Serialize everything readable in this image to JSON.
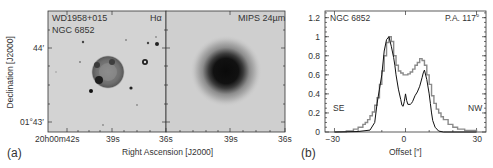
{
  "figure": {
    "panel_a": {
      "label": "(a)",
      "left_image": {
        "object_name": "WD1958+015",
        "object_alt_name": "NGC 6852",
        "band_label": "Hα"
      },
      "right_image": {
        "band_label": "MIPS 24µm"
      },
      "ylabel": "Declination [J2000]",
      "xlabel": "Right Ascension [J2000]",
      "y_ticks": [
        "44′",
        "01°43′"
      ],
      "x_ticks_left": [
        "20h00m42s",
        "39s",
        "36s"
      ],
      "x_ticks_right": [
        "39s",
        "36s"
      ]
    },
    "panel_b": {
      "label": "(b)",
      "title_left": "NGC 6852",
      "title_right": "P.A. 117°",
      "annot_left": "SE",
      "annot_right": "NW",
      "xlabel": "Offset [″]"
    }
  },
  "chart_data": {
    "type": "line",
    "title": "NGC 6852",
    "subtitle": "P.A. 117°",
    "xlabel": "Offset [″]",
    "ylabel": "",
    "xlim": [
      -34,
      34
    ],
    "ylim": [
      0,
      1.27
    ],
    "x_ticks": [
      -30,
      0,
      30
    ],
    "y_ticks": [
      0,
      0.2,
      0.4,
      0.6,
      0.8,
      1,
      1.2
    ],
    "y_tick_labels": [
      "0",
      "0.2",
      "0.4",
      "0.6",
      "0.8",
      "1",
      "1.2"
    ],
    "grid": false,
    "annotations": [
      "SE",
      "NW"
    ],
    "series": [
      {
        "name": "MIPS 24µm (gray, stepped)",
        "color": "#8a8a8a",
        "style": "step",
        "x": [
          -30,
          -25,
          -22,
          -20,
          -18,
          -17,
          -16,
          -15,
          -14,
          -13,
          -12,
          -11,
          -10,
          -9,
          -8,
          -7,
          -6,
          -5,
          -4,
          -3,
          -2,
          -1,
          0,
          1,
          2,
          3,
          4,
          5,
          6,
          7,
          8,
          9,
          10,
          11,
          12,
          13,
          14,
          15,
          16,
          18,
          20,
          22,
          25,
          30
        ],
        "values": [
          0,
          0.01,
          0.03,
          0.05,
          0.08,
          0.1,
          0.13,
          0.17,
          0.21,
          0.28,
          0.36,
          0.5,
          0.64,
          0.8,
          0.94,
          1.0,
          0.95,
          0.8,
          0.7,
          0.64,
          0.62,
          0.6,
          0.6,
          0.61,
          0.63,
          0.66,
          0.7,
          0.73,
          0.77,
          0.75,
          0.7,
          0.6,
          0.5,
          0.38,
          0.3,
          0.24,
          0.2,
          0.16,
          0.13,
          0.08,
          0.05,
          0.03,
          0.015,
          0
        ]
      },
      {
        "name": "Hα (black)",
        "color": "#111111",
        "style": "line",
        "x": [
          -30,
          -20,
          -15,
          -13,
          -12,
          -11,
          -10,
          -9,
          -8,
          -7,
          -6,
          -5,
          -4.5,
          -4,
          -3,
          -2,
          -1.5,
          -1,
          -0.5,
          0,
          0.5,
          1,
          2,
          2.5,
          3,
          4,
          5,
          6,
          7,
          7.5,
          8,
          9,
          10,
          10.5,
          11,
          11.5,
          12.5,
          14,
          16,
          30
        ],
        "values": [
          0,
          0.005,
          0.02,
          0.1,
          0.3,
          0.45,
          0.6,
          0.85,
          0.97,
          1.0,
          0.9,
          0.78,
          0.7,
          0.6,
          0.45,
          0.34,
          0.28,
          0.27,
          0.32,
          0.4,
          0.33,
          0.29,
          0.29,
          0.3,
          0.32,
          0.38,
          0.42,
          0.48,
          0.57,
          0.62,
          0.65,
          0.55,
          0.4,
          0.3,
          0.2,
          0.12,
          0.05,
          0.01,
          0,
          0
        ]
      }
    ]
  }
}
